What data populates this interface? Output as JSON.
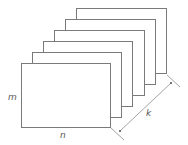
{
  "diagram": {
    "sheet_count": 6,
    "sheets": [
      {
        "x": 76,
        "y": 8,
        "w": 90,
        "h": 65
      },
      {
        "x": 65,
        "y": 19,
        "w": 90,
        "h": 65
      },
      {
        "x": 54,
        "y": 30,
        "w": 90,
        "h": 65
      },
      {
        "x": 43,
        "y": 41,
        "w": 89,
        "h": 65
      },
      {
        "x": 32,
        "y": 52,
        "w": 89,
        "h": 65
      },
      {
        "x": 21,
        "y": 63,
        "w": 89,
        "h": 64
      }
    ],
    "labels": {
      "height": "m",
      "width": "n",
      "depth": "k"
    },
    "colors": {
      "stroke": "#7a7a7a",
      "label": "#555555",
      "background": "#ffffff"
    }
  }
}
